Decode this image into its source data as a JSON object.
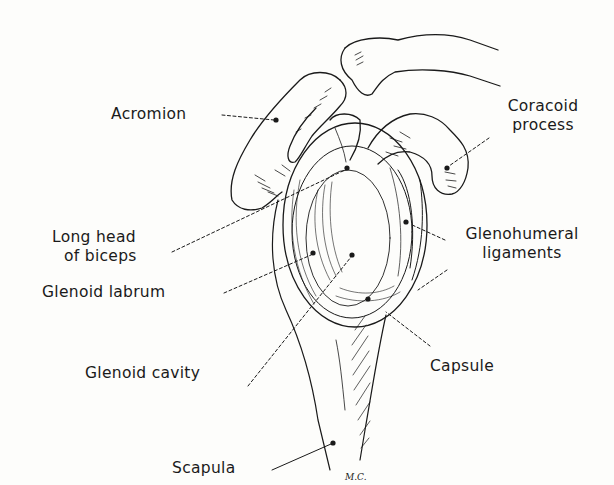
{
  "figure": {
    "signature": "M.C.",
    "colors": {
      "background": "#fdfdfb",
      "ink": "#1a1a1a"
    }
  },
  "labels": {
    "acromion": "Acromion",
    "coracoid_line1": "Coracoid",
    "coracoid_line2": "process",
    "long_head_line1": "Long head",
    "long_head_line2": "of biceps",
    "glenohumeral_line1": "Glenohumeral",
    "glenohumeral_line2": "ligaments",
    "glenoid_labrum": "Glenoid labrum",
    "capsule": "Capsule",
    "glenoid_cavity": "Glenoid cavity",
    "scapula": "Scapula"
  }
}
